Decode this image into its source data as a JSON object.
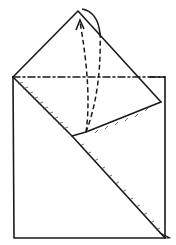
{
  "diagram": {
    "type": "origami-fold-instruction",
    "background": "#ffffff",
    "stroke_color": "#1a1a1a",
    "elements": [
      {
        "name": "square-paper-outline",
        "kind": "solid-edge"
      },
      {
        "name": "raised-triangle-flap",
        "kind": "solid-edge"
      },
      {
        "name": "valley-fold-line",
        "kind": "dash-dot",
        "label": "mountain/valley fold"
      },
      {
        "name": "diagonal-folded-edge",
        "kind": "solid-edge-hatched"
      },
      {
        "name": "inner-flap-edge",
        "kind": "solid-edge-hatched"
      },
      {
        "name": "fold-arrow-up",
        "kind": "dashed-arrow"
      },
      {
        "name": "rotation-arc",
        "kind": "curved-arrow"
      }
    ]
  }
}
